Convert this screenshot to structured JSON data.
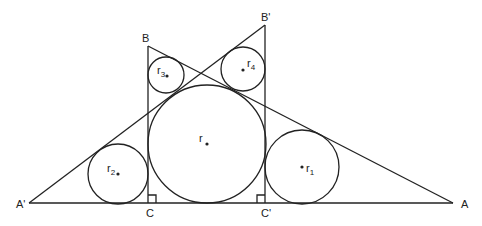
{
  "diagram": {
    "type": "geometry",
    "vertices": {
      "A": {
        "label": "A",
        "x": 453,
        "y": 203
      },
      "A_prime": {
        "label": "A'",
        "x": 29,
        "y": 203
      },
      "B": {
        "label": "B",
        "x": 148,
        "y": 46
      },
      "B_prime": {
        "label": "B'",
        "x": 265,
        "y": 25
      },
      "C": {
        "label": "C",
        "x": 148,
        "y": 203
      },
      "C_prime": {
        "label": "C'",
        "x": 265,
        "y": 203
      }
    },
    "circles": [
      {
        "name": "r",
        "label": "r",
        "sub": "",
        "cx": 207,
        "cy": 144,
        "radius": 59
      },
      {
        "name": "r1",
        "label": "r",
        "sub": "1",
        "cx": 302,
        "cy": 167,
        "radius": 37
      },
      {
        "name": "r2",
        "label": "r",
        "sub": "2",
        "cx": 118,
        "cy": 174,
        "radius": 30
      },
      {
        "name": "r3",
        "label": "r",
        "sub": "3",
        "cx": 166,
        "cy": 75,
        "radius": 18
      },
      {
        "name": "r4",
        "label": "r",
        "sub": "4",
        "cx": 243,
        "cy": 69,
        "radius": 22
      }
    ],
    "right_angle_marks": [
      "C",
      "C'"
    ]
  }
}
